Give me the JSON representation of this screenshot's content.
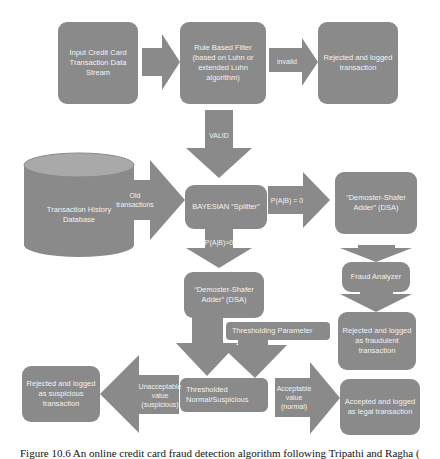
{
  "diagram": {
    "nodes": {
      "input": "Input Credit Card Transaction Data Stream",
      "rule_filter": "Rule Based Filter (based on Luhn or extended Luhn algorithm)",
      "rejected_logged": "Rejected and logged transaction",
      "history_db": "Transaction History Database",
      "bayesian_splitter": "BAYESIAN “Splitter”",
      "dsa_right": "“Demoster-Shafer Adder” (DSA)",
      "fraud_analyzer": "Fraud Analyzer",
      "rejected_fraudulent": "Rejected and logged as fraudulent transaction",
      "dsa_center": "“Demoster-Shafer Adder” (DSA)",
      "thresholding_parameter": "Thresholding Parameter",
      "thresholded": "Thresholded Normal/Suspicious",
      "rejected_suspicious": "Rejected and logged as suspicious transaction",
      "accepted_legal": "Accepted and logged as legal transaction"
    },
    "edges": {
      "input_to_filter": "",
      "invalid": "invalid",
      "valid": "VALID",
      "old_transactions": "Old transactions",
      "p_zero": "P(A|B) = 0",
      "p_positive": "P(A|B)>0",
      "unacceptable": "Unacceptable value (suspicious)",
      "acceptable": "Acceptable value (normal)"
    },
    "colors": {
      "box": "#8a8a8a",
      "text": "#f2f2f2",
      "background": "#ffffff"
    }
  },
  "caption": "Figure 10.6 An online credit card fraud detection algorithm following Tripathi and Ragha ("
}
